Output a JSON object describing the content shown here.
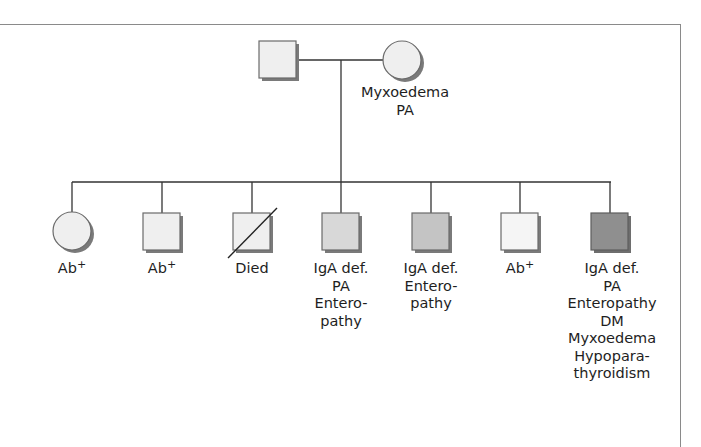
{
  "colors": {
    "line": "#333333",
    "shadow": "#7a7a7a",
    "outline": "#6a6a6a",
    "fill_unaffected": "#efefef",
    "fill_light": "#f5f5f5",
    "fill_medium": "#d8d8d8",
    "fill_medium_dark": "#c4c4c4",
    "fill_dark": "#8f8f8f"
  },
  "parents": {
    "father": {
      "sex": "male",
      "symbol": "square",
      "labels": []
    },
    "mother": {
      "sex": "female",
      "symbol": "circle",
      "labels": [
        "Myxoedema",
        "PA"
      ]
    }
  },
  "children": [
    {
      "sex": "female",
      "symbol": "circle",
      "deceased": false,
      "fill": "fill_unaffected",
      "labels": [
        "Ab+"
      ]
    },
    {
      "sex": "male",
      "symbol": "square",
      "deceased": false,
      "fill": "fill_unaffected",
      "labels": [
        "Ab+"
      ]
    },
    {
      "sex": "male",
      "symbol": "square",
      "deceased": true,
      "fill": "fill_unaffected",
      "labels": [
        "Died"
      ]
    },
    {
      "sex": "male",
      "symbol": "square",
      "deceased": false,
      "fill": "fill_medium",
      "labels": [
        "IgA def.",
        "PA",
        "Entero-",
        "pathy"
      ]
    },
    {
      "sex": "male",
      "symbol": "square",
      "deceased": false,
      "fill": "fill_medium_dark",
      "labels": [
        "IgA def.",
        "Entero-",
        "pathy"
      ]
    },
    {
      "sex": "male",
      "symbol": "square",
      "deceased": false,
      "fill": "fill_light",
      "labels": [
        "Ab+"
      ]
    },
    {
      "sex": "male",
      "symbol": "square",
      "deceased": false,
      "fill": "fill_dark",
      "labels": [
        "IgA def.",
        "PA",
        "Enteropathy",
        "DM",
        "Myxoedema",
        "Hypopara-",
        "thyroidism"
      ]
    }
  ],
  "text": {
    "mother_l1": "Myxoedema",
    "mother_l2": "PA",
    "c1_l1_base": "Ab",
    "c1_l1_sup": "+",
    "c2_l1_base": "Ab",
    "c2_l1_sup": "+",
    "c3_l1": "Died",
    "c4_l1": "IgA def.",
    "c4_l2": "PA",
    "c4_l3": "Entero-",
    "c4_l4": "pathy",
    "c5_l1": "IgA def.",
    "c5_l2": "Entero-",
    "c5_l3": "pathy",
    "c6_l1_base": "Ab",
    "c6_l1_sup": "+",
    "c7_l1": "IgA def.",
    "c7_l2": "PA",
    "c7_l3": "Enteropathy",
    "c7_l4": "DM",
    "c7_l5": "Myxoedema",
    "c7_l6": "Hypopara-",
    "c7_l7": "thyroidism"
  }
}
